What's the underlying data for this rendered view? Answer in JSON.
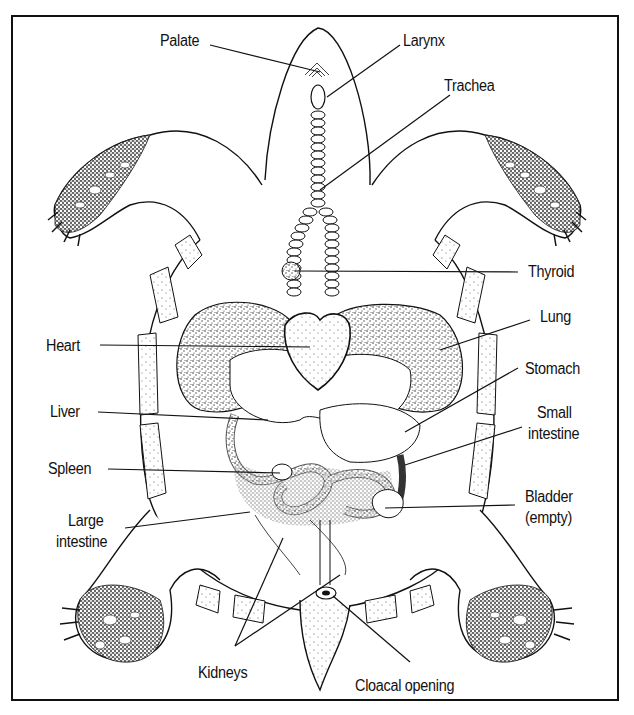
{
  "figure": {
    "colors": {
      "ink": "#111111",
      "background": "#ffffff",
      "stipple": "#333333"
    }
  },
  "labels": {
    "palate": "Palate",
    "larynx": "Larynx",
    "trachea": "Trachea",
    "thyroid": "Thyroid",
    "lung": "Lung",
    "heart": "Heart",
    "stomach": "Stomach",
    "liver": "Liver",
    "small_intestine_1": "Small",
    "small_intestine_2": "intestine",
    "spleen": "Spleen",
    "large_intestine_1": "Large",
    "large_intestine_2": "intestine",
    "bladder_1": "Bladder",
    "bladder_2": "(empty)",
    "kidneys": "Kidneys",
    "cloacal_opening": "Cloacal opening"
  }
}
